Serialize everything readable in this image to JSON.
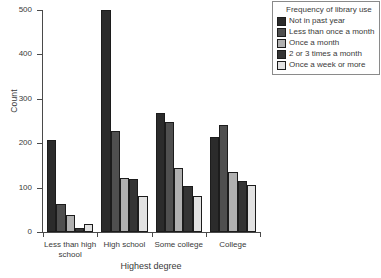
{
  "chart_data": {
    "type": "bar",
    "title": "",
    "subtitle": "",
    "xlabel": "Highest degree",
    "ylabel": "Count",
    "ylim": [
      0,
      500
    ],
    "yticks": [
      0,
      100,
      200,
      300,
      400,
      500
    ],
    "ytick_labels": [
      "0",
      "100",
      "200",
      "300",
      "400",
      "500"
    ],
    "grid": false,
    "legend_position": "top-right",
    "legend_title": "Frequency of library use",
    "categories": [
      "Less than high school",
      "High school",
      "Some college",
      "College"
    ],
    "series": [
      {
        "name": "Not in past year",
        "color": "#2b2b2b",
        "values": [
          208,
          500,
          268,
          213
        ]
      },
      {
        "name": "Less than once a month",
        "color": "#4f4f4f",
        "values": [
          62,
          228,
          248,
          242
        ]
      },
      {
        "name": "Once a month",
        "color": "#b0b0b0",
        "values": [
          38,
          122,
          145,
          135
        ]
      },
      {
        "name": "2 or 3 times a month",
        "color": "#343434",
        "values": [
          10,
          120,
          103,
          115
        ]
      },
      {
        "name": "Once a week or more",
        "color": "#e2e2e2",
        "values": [
          18,
          82,
          82,
          105
        ]
      }
    ]
  },
  "legend": {
    "title": "Frequency of library use",
    "items": [
      {
        "label": "Not in past year",
        "color": "#2b2b2b"
      },
      {
        "label": "Less than once a month",
        "color": "#4f4f4f"
      },
      {
        "label": "Once a month",
        "color": "#b0b0b0"
      },
      {
        "label": "2 or 3 times a month",
        "color": "#343434"
      },
      {
        "label": "Once a week or more",
        "color": "#e2e2e2"
      }
    ]
  },
  "axes": {
    "y_title": "Count",
    "x_title": "Highest degree"
  }
}
